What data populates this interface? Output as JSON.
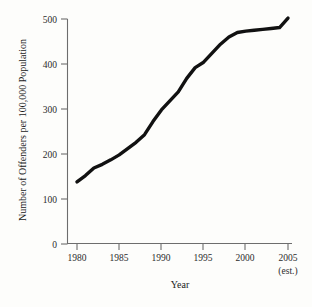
{
  "chart_data": {
    "type": "line",
    "title": "",
    "xlabel": "Year",
    "ylabel": "Number of Offenders per 100,000 Population",
    "xlim": [
      1978.7,
      2005.8
    ],
    "ylim": [
      0,
      500
    ],
    "grid": false,
    "legend": null,
    "xticks": [
      1980,
      1985,
      1990,
      1995,
      2000,
      2005
    ],
    "xtick_labels": [
      "1980",
      "1985",
      "1990",
      "1995",
      "2000",
      "2005"
    ],
    "yticks": [
      0,
      100,
      200,
      300,
      400,
      500
    ],
    "ytick_labels": [
      "0",
      "100",
      "200",
      "300",
      "400",
      "500"
    ],
    "annotations": [
      {
        "text": "(est.)",
        "x": 2005,
        "y": -60,
        "note": "sub-label under the 2005 tick"
      }
    ],
    "series": [
      {
        "name": "Offenders per 100,000 population",
        "color": "#111111",
        "x": [
          1980,
          1981,
          1982,
          1983,
          1984,
          1985,
          1986,
          1987,
          1988,
          1989,
          1990,
          1991,
          1992,
          1993,
          1994,
          1995,
          1996,
          1997,
          1998,
          1999,
          2000,
          2001,
          2002,
          2003,
          2004,
          2005
        ],
        "values": [
          138,
          152,
          169,
          177,
          187,
          198,
          212,
          226,
          243,
          272,
          298,
          318,
          338,
          368,
          392,
          404,
          424,
          444,
          460,
          470,
          473,
          475,
          477,
          479,
          481,
          502
        ]
      }
    ]
  },
  "axis_titles": {
    "x": "Year",
    "y": "Number of Offenders per 100,000 Population",
    "x_sub": "(est.)"
  },
  "colors": {
    "line": "#111111",
    "axis": "#6d6d6d",
    "background": "#fdfdfb",
    "text": "#1a1a1a"
  }
}
